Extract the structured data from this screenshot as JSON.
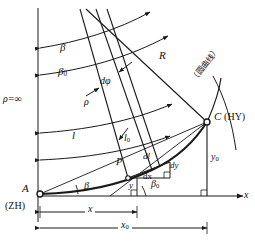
{
  "figure": {
    "kind": "spiral-transition-curve-geometry",
    "stroke_color": "#1a1a1a",
    "label_color": "#111111",
    "background": "#ffffff"
  },
  "labels": {
    "rho_infinity": "ρ=∞",
    "beta_upper": "β",
    "beta_zero_upper": "β",
    "beta_zero_upper_sub": "0",
    "d_phi": "dφ",
    "rho": "ρ",
    "radius_R": "R",
    "arc_l": "l",
    "arc_l0": "l",
    "arc_l0_sub": "0",
    "point_P": "P",
    "dl": "dl",
    "dy": "dy",
    "dx": "dx",
    "y_small": "y",
    "beta_lower": "β",
    "beta0_lower": "β",
    "beta0_lower_sub": "0",
    "point_A": "A",
    "point_A_code": "(ZH)",
    "point_C": "C",
    "point_C_code": "(HY)",
    "circular_curve_cjk": "（圆曲线）",
    "x_dim": "x",
    "x0_dim": "x",
    "x0_dim_sub": "0",
    "y0_dim": "y",
    "y0_dim_sub": "0",
    "axis_x": "x"
  }
}
